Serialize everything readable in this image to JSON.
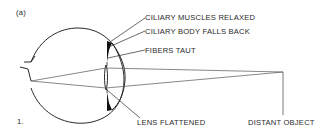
{
  "figure": {
    "panel_label": "(a)",
    "step_number": "1.",
    "labels": {
      "ciliary_muscles": "CILIARY MUSCLES RELAXED",
      "ciliary_body": "CILIARY BODY FALLS BACK",
      "fibers": "FIBERS TAUT",
      "lens": "LENS FLATTENED",
      "object": "DISTANT OBJECT"
    },
    "colors": {
      "line": "#2a2a2a",
      "background": "#ffffff"
    }
  }
}
